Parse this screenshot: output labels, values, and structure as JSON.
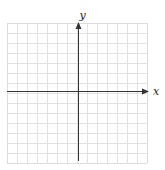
{
  "diagram": {
    "type": "coordinate-plane",
    "x_axis_label": "x",
    "y_axis_label": "y",
    "grid": {
      "columns": 14,
      "rows": 14,
      "left": 7,
      "top": 23,
      "cell": 10,
      "line_color": "#e2e2e2",
      "border_color": "#dcdcdc"
    },
    "origin": {
      "x": 78,
      "y": 91
    },
    "axis_color": "#333333",
    "x_axis_end": 149,
    "y_axis_top": 22,
    "y_axis_bottom": 161,
    "x_axis_start": 7
  }
}
